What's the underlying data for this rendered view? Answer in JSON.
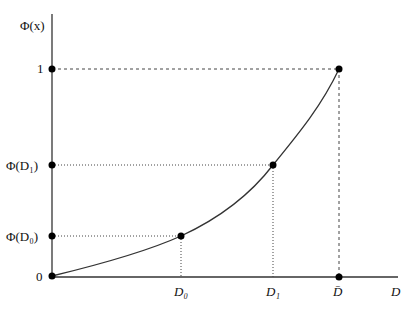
{
  "diagram": {
    "y_axis_label": "Φ(x)",
    "x_axis_label": "D",
    "y_ticks": [
      {
        "name": "one",
        "label": "1",
        "value": 1.0
      },
      {
        "name": "phi-d1",
        "label": "Φ(D₁)",
        "value": 0.545
      },
      {
        "name": "phi-d0",
        "label": "Φ(D₀)",
        "value": 0.2
      },
      {
        "name": "zero",
        "label": "0",
        "value": 0.0
      }
    ],
    "x_ticks": [
      {
        "name": "d0",
        "label": "D₀",
        "value": 0.446
      },
      {
        "name": "d1",
        "label": "D₁",
        "value": 0.764
      },
      {
        "name": "dbar",
        "label": "D̄",
        "value": 1.0
      }
    ],
    "curve": {
      "description": "convex increasing curve from origin to (D̄, 1)",
      "points": [
        [
          0,
          0
        ],
        [
          0.446,
          0.2
        ],
        [
          0.764,
          0.545
        ],
        [
          1.0,
          1.0
        ]
      ]
    },
    "guide_lines": [
      {
        "from": "one",
        "to": "dbar",
        "style": "dashed"
      },
      {
        "from": "phi-d1",
        "to": "d1",
        "style": "dotted"
      },
      {
        "from": "phi-d0",
        "to": "d0",
        "style": "dotted"
      }
    ],
    "colors": {
      "axis": "#333333",
      "curve": "#333333",
      "point": "#000000",
      "guide": "#444444"
    }
  }
}
